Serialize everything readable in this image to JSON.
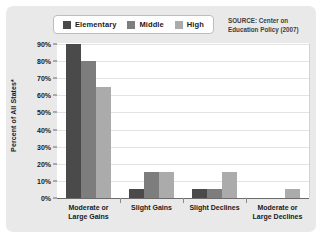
{
  "legend": {
    "items": [
      {
        "label": "Elementary",
        "color": "#4a4a4a"
      },
      {
        "label": "Middle",
        "color": "#7d7d7d"
      },
      {
        "label": "High",
        "color": "#ababab"
      }
    ]
  },
  "source": {
    "line1": "SOURCE: Center on",
    "line2": "Education Policy (2007)"
  },
  "chart_data": {
    "type": "bar",
    "title": "",
    "xlabel": "",
    "ylabel": "Percent of All States*",
    "ylim": [
      0,
      90
    ],
    "ytick_labels": [
      "0%",
      "10%",
      "20%",
      "30%",
      "40%",
      "50%",
      "60%",
      "70%",
      "80%",
      "90%"
    ],
    "ytick_values": [
      0,
      10,
      20,
      30,
      40,
      50,
      60,
      70,
      80,
      90
    ],
    "grid": true,
    "legend_position": "top-left",
    "categories": [
      "Moderate or Large Gains",
      "Slight Gains",
      "Slight Declines",
      "Moderate or Large Declines"
    ],
    "category_lines": [
      [
        "Moderate or",
        "Large Gains"
      ],
      [
        "Slight Gains",
        ""
      ],
      [
        "Slight Declines",
        ""
      ],
      [
        "Moderate or",
        "Large Declines"
      ]
    ],
    "series": [
      {
        "name": "Elementary",
        "color": "#4a4a4a",
        "values": [
          90,
          5,
          5,
          0
        ]
      },
      {
        "name": "Middle",
        "color": "#7d7d7d",
        "values": [
          80,
          15,
          5,
          0
        ]
      },
      {
        "name": "High",
        "color": "#ababab",
        "values": [
          65,
          15,
          15,
          5
        ]
      }
    ]
  }
}
